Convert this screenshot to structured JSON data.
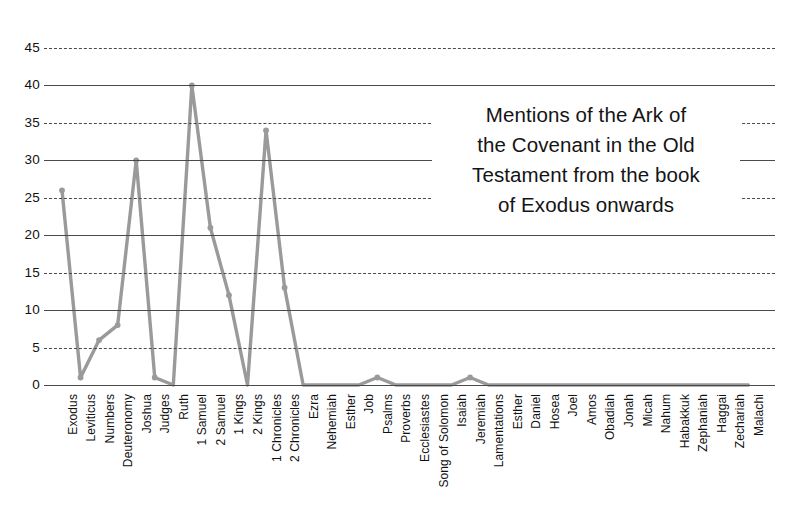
{
  "chart_data": {
    "type": "line",
    "title_lines": [
      "Mentions of the Ark of",
      "the Covenant in the Old",
      "Testament from the book",
      "of Exodus onwards"
    ],
    "xlabel": "",
    "ylabel": "",
    "ylim": [
      0,
      45
    ],
    "yticks": [
      0,
      5,
      10,
      15,
      20,
      25,
      30,
      35,
      40,
      45
    ],
    "grid": true,
    "legend": "none",
    "series_color": "#9a9a9a",
    "grid_color": "#4a4a4a",
    "text_color": "#111111",
    "categories": [
      "Exodus",
      "Leviticus",
      "Numbers",
      "Deuteronomy",
      "Joshua",
      "Judges",
      "Ruth",
      "1 Samuel",
      "2 Samuel",
      "1 Kings",
      "2 Kings",
      "1 Chronicles",
      "2 Chronicles",
      "Ezra",
      "Nehemiah",
      "Esther",
      "Job",
      "Psalms",
      "Proverbs",
      "Ecclesiastes",
      "Song of Solomon",
      "Isaiah",
      "Jeremiah",
      "Lamentations",
      "Esther",
      "Daniel",
      "Hosea",
      "Joel",
      "Amos",
      "Obadiah",
      "Jonah",
      "Micah",
      "Nahum",
      "Habakkuk",
      "Zephaniah",
      "Haggai",
      "Zechariah",
      "Malachi"
    ],
    "values": [
      26,
      1,
      6,
      8,
      30,
      1,
      0,
      40,
      21,
      12,
      0,
      34,
      13,
      0,
      0,
      0,
      0,
      1,
      0,
      0,
      0,
      0,
      1,
      0,
      0,
      0,
      0,
      0,
      0,
      0,
      0,
      0,
      0,
      0,
      0,
      0,
      0,
      0
    ]
  }
}
